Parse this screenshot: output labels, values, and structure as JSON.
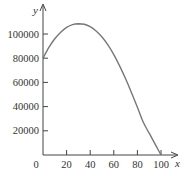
{
  "chart_data": {
    "type": "line",
    "title": "",
    "xlabel": "x",
    "ylabel": "y",
    "xlim": [
      0,
      105
    ],
    "ylim": [
      0,
      115000
    ],
    "grid": false,
    "legend": null,
    "x_ticks": [
      0,
      20,
      40,
      60,
      80,
      100
    ],
    "x_tick_labels": [
      "0",
      "20",
      "40",
      "60",
      "80",
      "100"
    ],
    "y_ticks": [
      20000,
      40000,
      60000,
      80000,
      100000
    ],
    "y_tick_labels": [
      "20000",
      "40000",
      "60000",
      "80000",
      "100000"
    ],
    "series": [
      {
        "name": "curve",
        "color": "#777777",
        "x": [
          0,
          5,
          10,
          15,
          20,
          25,
          30,
          35,
          40,
          45,
          50,
          55,
          60,
          65,
          70,
          75,
          80,
          85,
          90,
          95,
          100
        ],
        "y": [
          80000,
          89000,
          96000,
          101500,
          105500,
          107800,
          108500,
          108000,
          106000,
          102500,
          97500,
          91000,
          83000,
          73500,
          63000,
          51500,
          39500,
          27000,
          18000,
          9000,
          0
        ]
      }
    ]
  },
  "labels": {
    "x_axis": "x",
    "y_axis": "y",
    "origin": "0"
  }
}
